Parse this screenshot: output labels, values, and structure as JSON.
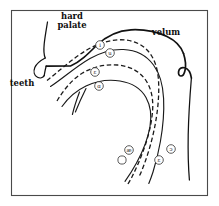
{
  "figure": {
    "frame_color": "#4a4a4a",
    "line_color": "#111111",
    "background": "#ffffff"
  },
  "annotations": [
    {
      "id": "hard-palate",
      "label_line1": "hard",
      "label_line2": "palate",
      "x": 72,
      "y": 16
    },
    {
      "id": "velum",
      "label_line1": "velum",
      "label_line2": "",
      "x": 166,
      "y": 32
    },
    {
      "id": "teeth",
      "label_line1": "teeth",
      "label_line2": "",
      "x": 22,
      "y": 83
    }
  ],
  "vowel_markers": [
    {
      "id": "vowel-i",
      "symbol": "i",
      "x": 100,
      "y": 45,
      "style": "filled"
    },
    {
      "id": "vowel-u",
      "symbol": "u",
      "x": 110,
      "y": 53,
      "style": "filled"
    },
    {
      "id": "vowel-eps",
      "symbol": "ɛ",
      "x": 95,
      "y": 72,
      "style": "filled"
    },
    {
      "id": "vowel-alpha",
      "symbol": "ɑ",
      "x": 99,
      "y": 86,
      "style": "filled"
    },
    {
      "id": "vowel-ash",
      "symbol": "æ",
      "x": 129,
      "y": 150,
      "style": "filled"
    },
    {
      "id": "vowel-open-o",
      "symbol": "ɔ",
      "x": 171,
      "y": 149,
      "style": "filled"
    },
    {
      "id": "vowel-eps2",
      "symbol": "ɛ",
      "x": 159,
      "y": 160,
      "style": "filled"
    },
    {
      "id": "vowel-blank",
      "symbol": "",
      "x": 122,
      "y": 160,
      "style": "open"
    }
  ],
  "curve_legend": {
    "dashed_meaning": "dashed tongue contour",
    "solid_meaning": "solid tongue contour"
  }
}
